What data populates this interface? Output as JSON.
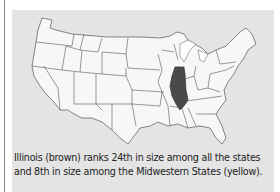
{
  "figure": {
    "highlighted_state": "Illinois",
    "highlight_color": "#4a4a4a",
    "state_fill": "#f7f7f7",
    "background_color": "#e4e4e4",
    "border_color": "#555555",
    "caption": "Illinois (brown) ranks 24th in size among all the states and 8th in size among the Midwestern States (yellow)."
  }
}
